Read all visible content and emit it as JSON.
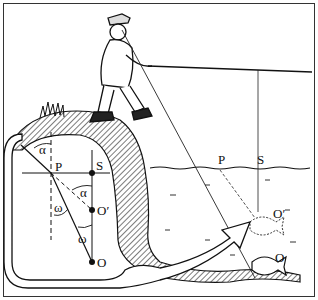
{
  "figure": {
    "inset_labels": {
      "alpha_top": "α",
      "P": "P",
      "S": "S",
      "alpha_mid": "α",
      "omega_left": "ω",
      "O_prime": "O′",
      "omega_bottom": "ω",
      "O": "O"
    },
    "scene_labels": {
      "P": "P",
      "S": "S",
      "O_prime": "O′",
      "O": "O"
    }
  }
}
